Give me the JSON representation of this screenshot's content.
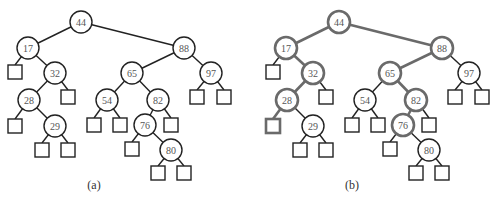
{
  "diagram": {
    "type": "binary-search-tree",
    "panels": [
      {
        "id": "a",
        "caption": "(a)",
        "offset_x": 0,
        "highlighted": []
      },
      {
        "id": "b",
        "caption": "(b)",
        "offset_x": 258,
        "highlighted": [
          "44",
          "17",
          "32",
          "28",
          "L28a",
          "88",
          "65",
          "82",
          "76"
        ]
      }
    ],
    "colors": {
      "line": "#222222",
      "highlight": "#6a6a6a",
      "label": "#555555"
    },
    "nodes": [
      {
        "id": "44",
        "label": "44",
        "x": 81,
        "y": 22
      },
      {
        "id": "17",
        "label": "17",
        "x": 28,
        "y": 48
      },
      {
        "id": "32",
        "label": "32",
        "x": 55,
        "y": 73
      },
      {
        "id": "28",
        "label": "28",
        "x": 29,
        "y": 100
      },
      {
        "id": "29",
        "label": "29",
        "x": 55,
        "y": 126
      },
      {
        "id": "88",
        "label": "88",
        "x": 184,
        "y": 48
      },
      {
        "id": "65",
        "label": "65",
        "x": 132,
        "y": 73
      },
      {
        "id": "54",
        "label": "54",
        "x": 107,
        "y": 100
      },
      {
        "id": "82",
        "label": "82",
        "x": 158,
        "y": 100
      },
      {
        "id": "76",
        "label": "76",
        "x": 145,
        "y": 125
      },
      {
        "id": "80",
        "label": "80",
        "x": 171,
        "y": 150
      },
      {
        "id": "97",
        "label": "97",
        "x": 211,
        "y": 73
      }
    ],
    "leaves": [
      {
        "id": "L17a",
        "x": 15,
        "y": 72
      },
      {
        "id": "L32b",
        "x": 68,
        "y": 97
      },
      {
        "id": "L28a",
        "x": 15,
        "y": 126
      },
      {
        "id": "L29a",
        "x": 42,
        "y": 150
      },
      {
        "id": "L29b",
        "x": 68,
        "y": 150
      },
      {
        "id": "L54a",
        "x": 94,
        "y": 125
      },
      {
        "id": "L54b",
        "x": 120,
        "y": 125
      },
      {
        "id": "L82b",
        "x": 171,
        "y": 125
      },
      {
        "id": "L76a",
        "x": 132,
        "y": 149
      },
      {
        "id": "L80a",
        "x": 158,
        "y": 173
      },
      {
        "id": "L80b",
        "x": 184,
        "y": 173
      },
      {
        "id": "L97a",
        "x": 197,
        "y": 97
      },
      {
        "id": "L97b",
        "x": 224,
        "y": 97
      }
    ],
    "edges": [
      [
        "44",
        "17"
      ],
      [
        "44",
        "88"
      ],
      [
        "17",
        "L17a"
      ],
      [
        "17",
        "32"
      ],
      [
        "32",
        "28"
      ],
      [
        "32",
        "L32b"
      ],
      [
        "28",
        "L28a"
      ],
      [
        "28",
        "29"
      ],
      [
        "29",
        "L29a"
      ],
      [
        "29",
        "L29b"
      ],
      [
        "88",
        "65"
      ],
      [
        "88",
        "97"
      ],
      [
        "65",
        "54"
      ],
      [
        "65",
        "82"
      ],
      [
        "54",
        "L54a"
      ],
      [
        "54",
        "L54b"
      ],
      [
        "82",
        "76"
      ],
      [
        "82",
        "L82b"
      ],
      [
        "76",
        "L76a"
      ],
      [
        "76",
        "80"
      ],
      [
        "80",
        "L80a"
      ],
      [
        "80",
        "L80b"
      ],
      [
        "97",
        "L97a"
      ],
      [
        "97",
        "L97b"
      ]
    ]
  }
}
